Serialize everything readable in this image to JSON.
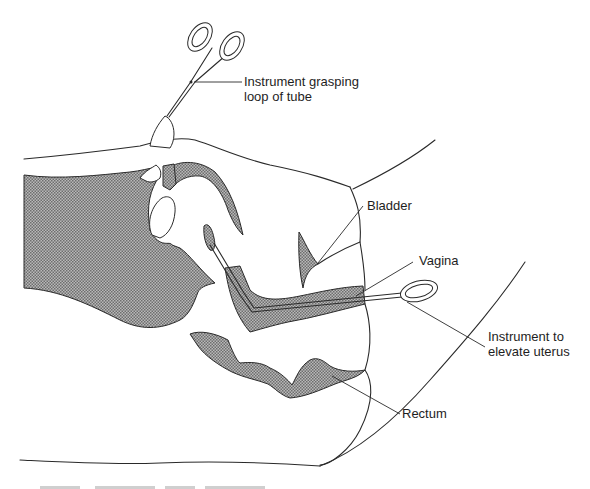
{
  "figure": {
    "colors": {
      "ink": "#2a2a2a",
      "tissue_shading": "#8a8a8a",
      "background": "#ffffff"
    }
  },
  "labels": {
    "grasping_instrument": {
      "line1": "Instrument grasping",
      "line2": "loop of tube"
    },
    "bladder": "Bladder",
    "vagina": "Vagina",
    "elevator_instrument": {
      "line1": "Instrument to",
      "line2": "elevate uterus"
    },
    "rectum": "Rectum"
  },
  "icons": {
    "grasping_forceps": "scissor-forceps-icon",
    "uterine_elevator": "loop-instrument-icon"
  }
}
